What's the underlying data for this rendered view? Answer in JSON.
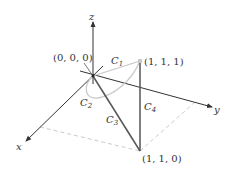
{
  "diagram": {
    "type": "3d-coordinate-axes-with-curves",
    "axes": {
      "x": {
        "label": "x"
      },
      "y": {
        "label": "y"
      },
      "z": {
        "label": "z"
      }
    },
    "points": {
      "origin": {
        "label": "(0, 0, 0)"
      },
      "p111": {
        "label": "(1, 1, 1)"
      },
      "p110": {
        "label": "(1, 1, 0)"
      }
    },
    "curves": [
      {
        "id": "C1",
        "letter": "C",
        "sub": "1",
        "style": "light-gray straight segment from (0,0,0) to (1,1,1)"
      },
      {
        "id": "C2",
        "letter": "C",
        "sub": "2",
        "style": "light-gray curved path from (0,0,0) to (1,1,1)"
      },
      {
        "id": "C3",
        "letter": "C",
        "sub": "3",
        "style": "dark segment from (0,0,0) to (1,1,0)"
      },
      {
        "id": "C4",
        "letter": "C",
        "sub": "4",
        "style": "dark vertical segment from (1,1,0) to (1,1,1)"
      }
    ],
    "colors": {
      "axis": "#333333",
      "curve_light": "#c8c8c8",
      "curve_dark": "#555555",
      "dashed": "#cccccc",
      "text": "#333333"
    }
  }
}
